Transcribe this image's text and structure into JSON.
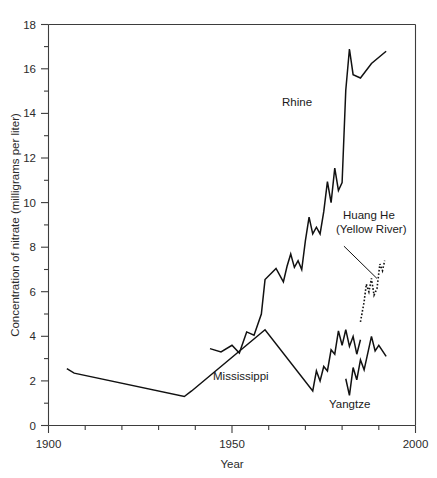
{
  "chart_data": {
    "type": "line",
    "title": "",
    "xlabel": "Year",
    "ylabel": "Concentration of nitrate (milligrams per liter)",
    "xlim": [
      1900,
      2000
    ],
    "ylim": [
      0,
      18
    ],
    "x_ticks_major": [
      1900,
      1950,
      2000
    ],
    "x_tick_labels": [
      "1900",
      "1950",
      "2000"
    ],
    "x_ticks_minor": [
      1910,
      1920,
      1930,
      1940,
      1960,
      1970,
      1980,
      1990
    ],
    "y_ticks_major": [
      0,
      2,
      4,
      6,
      8,
      10,
      12,
      14,
      16,
      18
    ],
    "y_tick_labels": [
      "0",
      "2",
      "4",
      "6",
      "8",
      "10",
      "12",
      "14",
      "16",
      "18"
    ],
    "y_ticks_minor": [
      1,
      3,
      5,
      7,
      9,
      11,
      13,
      15,
      17
    ],
    "grid": false,
    "legend_position": "inline-annotations",
    "series": [
      {
        "name": "Rhine",
        "style": "solid",
        "label_x": 1963,
        "label_y": 13.55,
        "points": [
          [
            1944,
            3.45
          ],
          [
            1947,
            3.3
          ],
          [
            1950,
            3.6
          ],
          [
            1952,
            3.25
          ],
          [
            1954,
            4.2
          ],
          [
            1956,
            4.05
          ],
          [
            1958,
            5.0
          ],
          [
            1959,
            6.55
          ],
          [
            1962,
            7.05
          ],
          [
            1964,
            6.45
          ],
          [
            1965,
            7.15
          ],
          [
            1966,
            7.7
          ],
          [
            1967,
            7.1
          ],
          [
            1968,
            7.4
          ],
          [
            1969,
            7.0
          ],
          [
            1970,
            8.3
          ],
          [
            1971,
            9.35
          ],
          [
            1972,
            8.6
          ],
          [
            1973,
            8.9
          ],
          [
            1974,
            8.6
          ],
          [
            1975,
            9.6
          ],
          [
            1976,
            10.95
          ],
          [
            1977,
            10.0
          ],
          [
            1978,
            11.55
          ],
          [
            1979,
            10.55
          ],
          [
            1980,
            10.9
          ],
          [
            1981,
            15.05
          ],
          [
            1982,
            16.9
          ],
          [
            1983,
            15.75
          ],
          [
            1985,
            15.6
          ],
          [
            1988,
            16.25
          ],
          [
            1992,
            16.8
          ]
        ]
      },
      {
        "name": "Mississippi",
        "style": "solid",
        "label_x": 1957,
        "label_y": 2.55,
        "points": [
          [
            1905,
            2.55
          ],
          [
            1907,
            2.35
          ],
          [
            1937,
            1.3
          ],
          [
            1939,
            1.55
          ],
          [
            1959,
            4.3
          ],
          [
            1972,
            1.55
          ],
          [
            1973,
            2.45
          ],
          [
            1974,
            2.0
          ],
          [
            1975,
            2.65
          ],
          [
            1976,
            2.45
          ],
          [
            1977,
            3.4
          ],
          [
            1978,
            3.2
          ],
          [
            1979,
            4.25
          ],
          [
            1980,
            3.6
          ],
          [
            1981,
            4.3
          ],
          [
            1982,
            3.55
          ],
          [
            1983,
            4.0
          ],
          [
            1984,
            3.2
          ],
          [
            1985,
            3.85
          ]
        ]
      },
      {
        "name": "Yangtze",
        "style": "solid",
        "label_x": 1981,
        "label_y": 1.25,
        "points": [
          [
            1981,
            2.1
          ],
          [
            1982,
            1.35
          ],
          [
            1983,
            2.6
          ],
          [
            1984,
            2.05
          ],
          [
            1985,
            2.95
          ],
          [
            1986,
            2.5
          ],
          [
            1987,
            3.25
          ],
          [
            1988,
            4.0
          ],
          [
            1989,
            3.35
          ],
          [
            1990,
            3.6
          ],
          [
            1992,
            3.1
          ]
        ]
      },
      {
        "name": "Huang He (Yellow River)",
        "style": "dotted",
        "label_x": 1972,
        "label_y": 8.6,
        "label_line1": "Huang He",
        "label_line2": "(Yellow River)",
        "points": [
          [
            1985,
            4.65
          ],
          [
            1986,
            5.55
          ],
          [
            1986.6,
            6.35
          ],
          [
            1987.3,
            6.0
          ],
          [
            1988,
            6.6
          ],
          [
            1988.7,
            5.85
          ],
          [
            1989.5,
            6.15
          ],
          [
            1990.3,
            7.25
          ],
          [
            1991,
            6.95
          ],
          [
            1991.6,
            7.4
          ]
        ],
        "leader_from": [
          1980.5,
          8.05
        ],
        "leader_to": [
          1989.5,
          6.6
        ]
      }
    ]
  },
  "axis": {
    "y_title": "Concentration of nitrate (milligrams per liter)",
    "x_title": "Year",
    "x_label_left": "1900",
    "x_label_mid": "1950",
    "x_label_right": "2000",
    "y_label_0": "0",
    "y_label_2": "2",
    "y_label_4": "4",
    "y_label_6": "6",
    "y_label_8": "8",
    "y_label_10": "10",
    "y_label_12": "12",
    "y_label_14": "14",
    "y_label_16": "16",
    "y_label_18": "18"
  },
  "annotations": {
    "rhine": "Rhine",
    "mississippi": "Mississippi",
    "yangtze": "Yangtze",
    "huanghe_line1": "Huang He",
    "huanghe_line2": "(Yellow River)"
  }
}
